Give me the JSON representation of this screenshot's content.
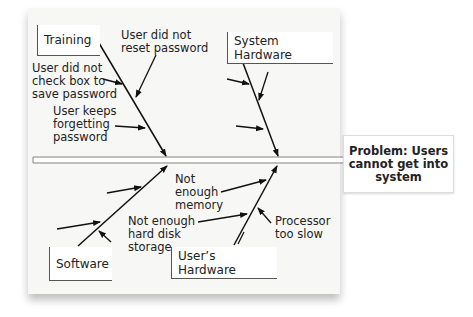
{
  "diagram": {
    "type": "fishbone",
    "problem": "Problem: Users cannot get into system",
    "problem_lines": [
      "Problem: Users",
      "cannot get into",
      "system"
    ],
    "categories": [
      {
        "name": "Training",
        "position": "top-left",
        "causes": [
          "User did not reset password",
          "User did not check box to save password",
          "User keeps forgetting password"
        ]
      },
      {
        "name": "System Hardware",
        "position": "top-right",
        "causes": []
      },
      {
        "name": "Software",
        "position": "bottom-left",
        "causes": []
      },
      {
        "name": "User's Hardware",
        "position": "bottom-right",
        "causes": [
          "Not enough memory",
          "Not enough hard disk storage",
          "Processor too slow"
        ]
      }
    ],
    "labels": {
      "training": "Training",
      "system_hardware": "System Hardware",
      "software": "Software",
      "users_hardware": "User’s Hardware",
      "reset_1": "User did not",
      "reset_2": "reset password",
      "check_1": "User did not",
      "check_2": "check box to",
      "check_3": "save password",
      "forget_1": "User keeps",
      "forget_2": "forgetting",
      "forget_3": "password",
      "mem_1": "Not",
      "mem_2": "enough",
      "mem_3": "memory",
      "disk_1": "Not enough",
      "disk_2": "hard disk",
      "disk_3": "storage",
      "proc_1": "Processor",
      "proc_2": "too slow"
    }
  }
}
